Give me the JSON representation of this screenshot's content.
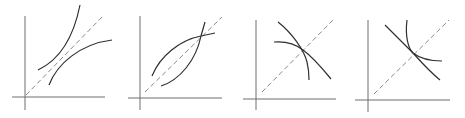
{
  "figure": {
    "colors": {
      "axis": "#6e6e6e",
      "diagonal": "#8a8a8a",
      "curve": "#2f2f2f",
      "background": "#ffffff"
    },
    "panels": [
      {
        "id": "panel-1",
        "relation": "two curves not intersecting, one above and one below the 45-degree line",
        "y_axis": [
          25,
          16,
          25,
          110
        ],
        "x_axis": [
          12,
          97,
          105,
          97
        ],
        "diagonal": [
          26,
          95,
          103,
          16
        ],
        "curves": [
          "M38,70 C55,62 72,45 80,5",
          "M49,85 C57,64 80,44 112,40"
        ]
      },
      {
        "id": "panel-2",
        "relation": "two curves intersecting on the 45-degree line at upper right",
        "y_axis": [
          140,
          16,
          140,
          110
        ],
        "x_axis": [
          128,
          98,
          222,
          98
        ],
        "diagonal": [
          145,
          92,
          222,
          17
        ],
        "curves": [
          "M152,76 C160,56 180,40 201,36 L215,33",
          "M161,86 C180,80 196,60 201,36 L205,22"
        ]
      },
      {
        "id": "panel-3",
        "relation": "two decreasing concave curves intersecting on the 45-degree line",
        "y_axis": [
          256,
          20,
          256,
          110
        ],
        "x_axis": [
          243,
          99,
          336,
          99
        ],
        "diagonal": [
          262,
          92,
          335,
          18
        ],
        "curves": [
          "M278,22 C292,33 304,50 307,62 C309,70 309,76 309,80",
          "M274,42 C288,41 298,46 303,50 C314,58 322,68 331,79"
        ]
      },
      {
        "id": "panel-4",
        "relation": "two decreasing convex curves intersecting on the 45-degree line",
        "y_axis": [
          368,
          20,
          368,
          112
        ],
        "x_axis": [
          355,
          100,
          450,
          100
        ],
        "diagonal": [
          374,
          94,
          449,
          20
        ],
        "curves": [
          "M385,25 C396,36 405,45 413,53 C422,63 430,72 440,80",
          "M407,20 C405,36 408,48 413,53 C422,60 432,61 442,61"
        ]
      }
    ]
  }
}
